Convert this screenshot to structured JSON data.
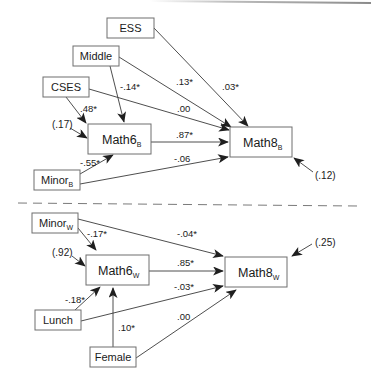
{
  "diagram": {
    "type": "path-diagram",
    "sections": [
      "between (B)",
      "within (W)"
    ],
    "nodes": {
      "ess": {
        "label": "ESS",
        "sub": ""
      },
      "middle": {
        "label": "Middle",
        "sub": ""
      },
      "cses": {
        "label": "CSES",
        "sub": ""
      },
      "math6b": {
        "label": "Math6",
        "sub": "B"
      },
      "minorb": {
        "label": "Minor",
        "sub": "B"
      },
      "math8b": {
        "label": "Math8",
        "sub": "B"
      },
      "minorw": {
        "label": "Minor",
        "sub": "W"
      },
      "math6w": {
        "label": "Math6",
        "sub": "W"
      },
      "lunch": {
        "label": "Lunch",
        "sub": ""
      },
      "female": {
        "label": "Female",
        "sub": ""
      },
      "math8w": {
        "label": "Math8",
        "sub": "W"
      }
    },
    "paths": {
      "cses_math6b": {
        "from": "CSES",
        "to": "Math6B",
        "coef": ".48*"
      },
      "middle_math6b": {
        "from": "Middle",
        "to": "Math6B",
        "coef": "-.14*"
      },
      "minorb_math6b": {
        "from": "MinorB",
        "to": "Math6B",
        "coef": "-.55*"
      },
      "ess_math8b": {
        "from": "ESS",
        "to": "Math8B",
        "coef": ".03*"
      },
      "middle_math8b": {
        "from": "Middle",
        "to": "Math8B",
        "coef": ".13*"
      },
      "cses_math8b": {
        "from": "CSES",
        "to": "Math8B",
        "coef": ".00"
      },
      "math6b_math8b": {
        "from": "Math6B",
        "to": "Math8B",
        "coef": ".87*"
      },
      "minorb_math8b": {
        "from": "MinorB",
        "to": "Math8B",
        "coef": "-.06"
      },
      "minorw_math6w": {
        "from": "MinorW",
        "to": "Math6W",
        "coef": "-.17*"
      },
      "lunch_math6w": {
        "from": "Lunch",
        "to": "Math6W",
        "coef": "-.18*"
      },
      "female_math6w": {
        "from": "Female",
        "to": "Math6W",
        "coef": ".10*"
      },
      "minorw_math8w": {
        "from": "MinorW",
        "to": "Math8W",
        "coef": "-.04*"
      },
      "math6w_math8w": {
        "from": "Math6W",
        "to": "Math8W",
        "coef": ".85*"
      },
      "lunch_math8w": {
        "from": "Lunch",
        "to": "Math8W",
        "coef": "-.03*"
      },
      "female_math8w": {
        "from": "Female",
        "to": "Math8W",
        "coef": ".00"
      }
    },
    "residuals": {
      "math6b": "(.17)",
      "math8b": "(.12)",
      "math6w": "(.92)",
      "math8w": "(.25)"
    },
    "colors": {
      "box_stroke": "#6e6e6e",
      "arrow": "#3a3a3a",
      "text": "#1a1a1a",
      "divider": "#7a7a7a"
    }
  }
}
